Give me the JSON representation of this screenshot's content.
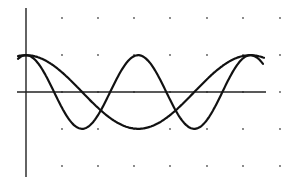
{
  "chart_data": {
    "type": "line",
    "title": "",
    "xlabel": "",
    "ylabel": "",
    "grid": "dotted (dots at unit intersections)",
    "legend": null,
    "xlim": [
      -0.25,
      6.9
    ],
    "ylim": [
      -2.35,
      2.3
    ],
    "x_origin_px": 26,
    "y_origin_px": 92,
    "px_per_unit_x": 36.2,
    "px_per_unit_y": 36.8,
    "series": [
      {
        "name": "slow curve (cos t)",
        "function": "y = cos(pi * x / 3.1)",
        "x": [
          0,
          0.5,
          1.0,
          1.5,
          2.0,
          2.5,
          3.0,
          3.1,
          3.5,
          4.0,
          4.5,
          5.0,
          5.5,
          6.0,
          6.2,
          6.5
        ],
        "values": [
          1.0,
          0.87,
          0.52,
          0.05,
          -0.43,
          -0.82,
          -1.0,
          -1.0,
          -0.92,
          -0.59,
          -0.1,
          0.39,
          0.79,
          0.99,
          1.0,
          0.96
        ]
      },
      {
        "name": "fast curve (cos 2t)",
        "function": "y = cos(2 * pi * x / 3.1)",
        "x": [
          0,
          0.5,
          0.78,
          1.0,
          1.55,
          2.0,
          2.33,
          2.5,
          3.1,
          3.5,
          3.88,
          4.0,
          4.65,
          5.0,
          5.43,
          5.5,
          6.0,
          6.2,
          6.5
        ],
        "values": [
          1.0,
          0.52,
          0.0,
          -0.43,
          -1.0,
          -0.62,
          0.0,
          0.32,
          1.0,
          0.72,
          0.0,
          -0.24,
          -1.0,
          -0.76,
          0.0,
          0.13,
          0.96,
          1.0,
          0.73
        ]
      }
    ],
    "annotations": []
  },
  "render": {
    "axis_color": "#222222",
    "curve_color": "#111111",
    "dot_color": "#555555",
    "background": "#ffffff",
    "x_axis": {
      "y_px": 92,
      "x_start_px": 17,
      "x_end_px": 266
    },
    "y_axis": {
      "x_px": 26,
      "y_start_px": 8,
      "y_end_px": 177
    },
    "grid_dots_x_px": [
      62,
      98,
      134,
      170,
      207,
      243,
      280
    ],
    "grid_dots_y_px": [
      18,
      55,
      92,
      129,
      166
    ],
    "curve_x_start_px": 18,
    "curve_x_end_px": 264
  }
}
